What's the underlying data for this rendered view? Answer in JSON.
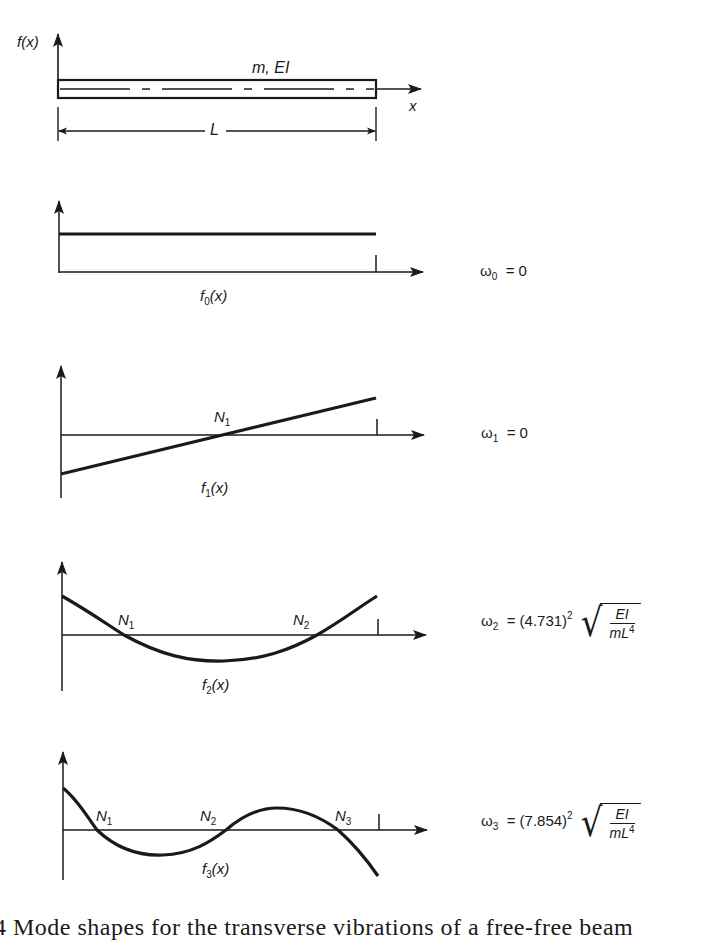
{
  "figure": {
    "beam": {
      "ylabel": "f(x)",
      "xlabel": "x",
      "properties_label": "m, EI",
      "length_label": "L"
    },
    "modes": [
      {
        "id": 0,
        "curve_label": "f",
        "curve_sub": "0",
        "curve_arg": "(x)",
        "nodes": [],
        "omega_symbol": "ω",
        "omega_sub": "0",
        "omega_eq": "= 0"
      },
      {
        "id": 1,
        "curve_label": "f",
        "curve_sub": "1",
        "curve_arg": "(x)",
        "nodes": [
          {
            "n": "N",
            "sub": "1"
          }
        ],
        "omega_symbol": "ω",
        "omega_sub": "1",
        "omega_eq": "= 0"
      },
      {
        "id": 2,
        "curve_label": "f",
        "curve_sub": "2",
        "curve_arg": "(x)",
        "nodes": [
          {
            "n": "N",
            "sub": "1"
          },
          {
            "n": "N",
            "sub": "2"
          }
        ],
        "omega_symbol": "ω",
        "omega_sub": "2",
        "omega_eq": "= (4.731)",
        "omega_exp": "2",
        "sqrt_num": "EI",
        "sqrt_den": "mL",
        "sqrt_den_exp": "4"
      },
      {
        "id": 3,
        "curve_label": "f",
        "curve_sub": "3",
        "curve_arg": "(x)",
        "nodes": [
          {
            "n": "N",
            "sub": "1"
          },
          {
            "n": "N",
            "sub": "2"
          },
          {
            "n": "N",
            "sub": "3"
          }
        ],
        "omega_symbol": "ω",
        "omega_sub": "3",
        "omega_eq": "= (7.854)",
        "omega_exp": "2",
        "sqrt_num": "EI",
        "sqrt_den": "mL",
        "sqrt_den_exp": "4"
      }
    ],
    "caption": "4  Mode shapes for the transverse vibrations of a free-free beam"
  }
}
